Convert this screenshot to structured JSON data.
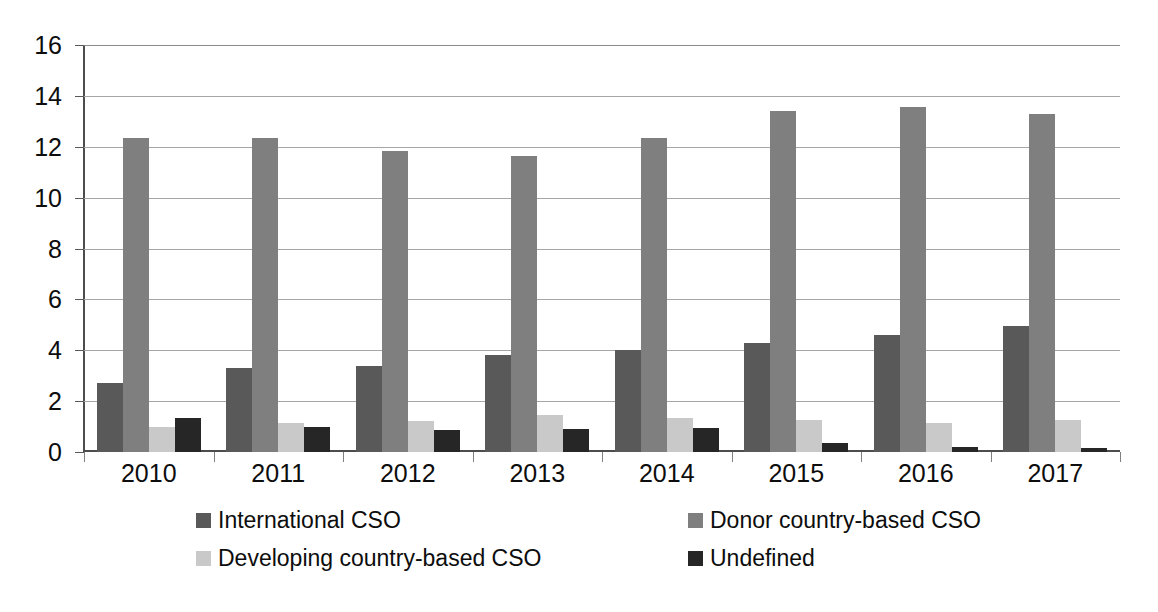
{
  "chart_data": {
    "type": "bar",
    "title": "",
    "subtitle": "",
    "xlabel": "",
    "ylabel": "",
    "ylim": [
      0,
      16
    ],
    "ytick_step": 2,
    "yticks": [
      16,
      14,
      12,
      10,
      8,
      6,
      4,
      2,
      0
    ],
    "grid": true,
    "legend_position": "bottom",
    "categories": [
      "2010",
      "2011",
      "2012",
      "2013",
      "2014",
      "2015",
      "2016",
      "2017"
    ],
    "series": [
      {
        "name": "International CSO",
        "color": "#595959",
        "values": [
          2.7,
          3.3,
          3.4,
          3.8,
          4.0,
          4.3,
          4.6,
          4.95
        ]
      },
      {
        "name": "Donor country-based CSO",
        "color": "#7f7f7f",
        "values": [
          12.35,
          12.35,
          11.85,
          11.65,
          12.35,
          13.4,
          13.55,
          13.3
        ]
      },
      {
        "name": "Developing country-based CSO",
        "color": "#c9c9c9",
        "values": [
          1.0,
          1.15,
          1.2,
          1.45,
          1.35,
          1.25,
          1.15,
          1.25
        ]
      },
      {
        "name": "Undefined",
        "color": "#262626",
        "values": [
          1.35,
          1.0,
          0.85,
          0.9,
          0.95,
          0.35,
          0.2,
          0.15
        ]
      }
    ]
  },
  "legend": {
    "items": [
      {
        "label": "International CSO",
        "color": "#595959"
      },
      {
        "label": "Donor country-based CSO",
        "color": "#7f7f7f"
      },
      {
        "label": "Developing country-based CSO",
        "color": "#c9c9c9"
      },
      {
        "label": "Undefined",
        "color": "#262626"
      }
    ]
  },
  "axes": {
    "y_tick_labels": [
      "16",
      "14",
      "12",
      "10",
      "8",
      "6",
      "4",
      "2",
      "0"
    ],
    "x_tick_labels": [
      "2010",
      "2011",
      "2012",
      "2013",
      "2014",
      "2015",
      "2016",
      "2017"
    ]
  },
  "colors": {
    "gridline": "#a6a6a6",
    "axis": "#4d4d4d",
    "text": "#0d0d0d",
    "background": "#ffffff"
  }
}
